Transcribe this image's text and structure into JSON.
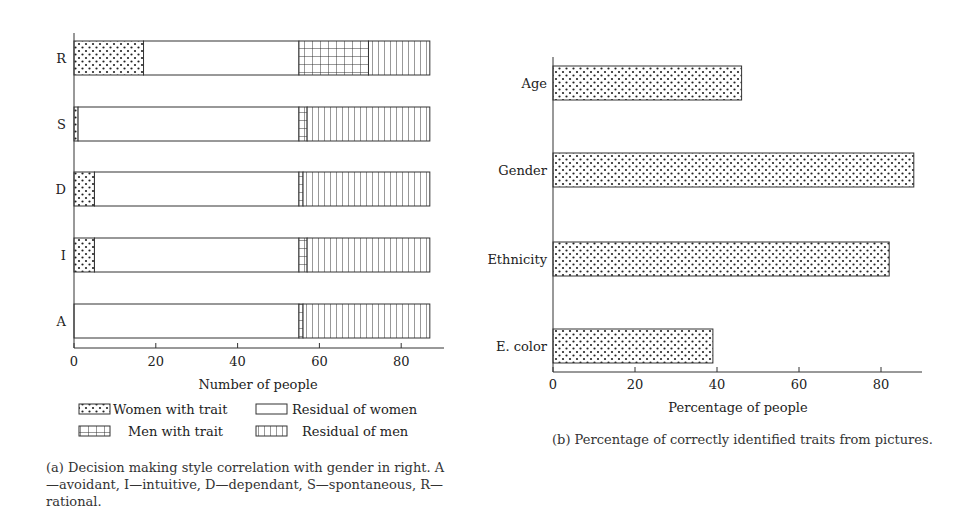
{
  "figure_a": {
    "caption": "(a) Decision making style correlation with gender in right. A—avoidant, I—intuitive, D—dependant, S—spontaneous, R—rational.",
    "xlabel": "Number of people",
    "legend": [
      "Women with trait",
      "Residual of women",
      "Men with trait",
      "Residual of men"
    ]
  },
  "figure_b": {
    "caption": "(b) Percentage of correctly identified traits from pictures.",
    "xlabel": "Percentage of people"
  },
  "chart_data": [
    {
      "type": "bar",
      "orientation": "horizontal",
      "stacked": true,
      "title": "",
      "xlabel": "Number of people",
      "ylabel": "",
      "categories": [
        "A",
        "I",
        "D",
        "S",
        "R"
      ],
      "series": [
        {
          "name": "Women with trait",
          "pattern": "dots",
          "values": [
            0,
            5,
            5,
            1,
            17
          ]
        },
        {
          "name": "Residual of women",
          "pattern": "none",
          "values": [
            55,
            50,
            50,
            54,
            38
          ]
        },
        {
          "name": "Men with trait",
          "pattern": "grid",
          "values": [
            1,
            2,
            1,
            2,
            17
          ]
        },
        {
          "name": "Residual of men",
          "pattern": "vertical-lines",
          "values": [
            31,
            30,
            31,
            30,
            15
          ]
        }
      ],
      "xticks": [
        0,
        20,
        40,
        60,
        80
      ],
      "xlim": [
        0,
        90
      ],
      "grid": false,
      "legend_position": "below"
    },
    {
      "type": "bar",
      "orientation": "horizontal",
      "title": "",
      "xlabel": "Percentage of people",
      "ylabel": "",
      "categories": [
        "E. color",
        "Ethnicity",
        "Gender",
        "Age"
      ],
      "values": [
        39,
        82,
        88,
        46
      ],
      "pattern": "dots",
      "xticks": [
        0,
        20,
        40,
        60,
        80
      ],
      "xlim": [
        0,
        90
      ],
      "grid": false
    }
  ]
}
